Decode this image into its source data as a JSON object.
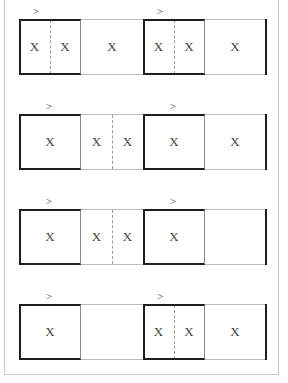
{
  "diagram": {
    "marker_symbol": ">",
    "cell_symbol": "X",
    "rows": [
      {
        "left_group": {
          "box": [
            "X",
            "X"
          ],
          "outside": [
            "X"
          ],
          "outside_split": false
        },
        "right_group": {
          "box": [
            "X",
            "X"
          ],
          "outside": [
            "X"
          ],
          "outside_split": false
        }
      },
      {
        "left_group": {
          "box": [
            "X"
          ],
          "outside": [
            "X",
            "X"
          ],
          "outside_split": true
        },
        "right_group": {
          "box": [
            "X"
          ],
          "outside": [
            "X"
          ],
          "outside_split": false
        }
      },
      {
        "left_group": {
          "box": [
            "X"
          ],
          "outside": [
            "X",
            "X"
          ],
          "outside_split": true
        },
        "right_group": {
          "box": [
            "X"
          ],
          "outside": [
            ""
          ],
          "outside_split": false
        }
      },
      {
        "left_group": {
          "box": [
            "X"
          ],
          "outside": [
            ""
          ],
          "outside_split": false
        },
        "right_group": {
          "box": [
            "X",
            "X"
          ],
          "outside": [
            "X"
          ],
          "outside_split": false
        }
      }
    ]
  }
}
